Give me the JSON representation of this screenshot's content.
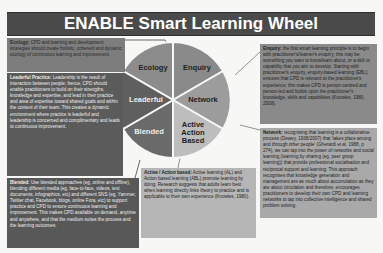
{
  "title": "ENABLE Smart Learning Wheel",
  "wheel": {
    "segments": [
      {
        "label": "Ecology",
        "color": "#8c8c8c"
      },
      {
        "label": "Enquiry",
        "color": "#8a8a8a"
      },
      {
        "label": "Network",
        "color": "#9a9a9a"
      },
      {
        "label": "Active Action Based",
        "color": "#bdbdbd"
      },
      {
        "label": "Blended",
        "color": "#6a6a6a"
      },
      {
        "label": "Leaderful",
        "color": "#5f5f5f"
      }
    ]
  },
  "boxes": {
    "ecology": {
      "heading": "Ecology:",
      "text": " CPD and learning and development strategies should create holistic, coherent and dynamic ecology of continuous learning and improvement."
    },
    "leaderful": {
      "heading": "Leaderful Practice:",
      "text": " Leadership is the result of interaction between people; hence, CPD should enable practitioners to build on their strengths, knowledge and expertise, and lead in their practice and area of expertise toward shared goals and within the context of their team. This creates a dynamic environment where practice is leaderful and leadership is concerned and complimentary and leads to continuous improvement."
    },
    "blended": {
      "heading": "Blended:",
      "text": " Use blended approaches (eg, online and offline), blending different media (eg, face-to-face, videos, text documents, infographics, etc) and different SNS (eg, Yammer, Twitter chat, Facebook, blogs, online Fora, etc) to support practice and CPD to ensure continuous learning and improvement. This makes CPD available on demand, anytime and anywhere, and that the medium suites the process and the learning outcomes."
    },
    "enquiry": {
      "heading": "Enquiry:",
      "text": " the first smart learning principle is to begin with practitioner's/learner's enquiry; this may be something you want to know/learn about, or a skill or capability that you aim to develop. Starting with practitioner's enquiry, enquiry-based learning (EBL), ensures that CPD is relevant to the practitioner's experience; this makes CPD is person-centred and person-led and builds upon the practitioner's knowledge, skills and capabilities (Knowles, 1980, 2008)."
    },
    "network": {
      "heading": "Network:",
      "text": " recognising that learning is a collaborative process (Dewey, 1938/2007) that 'takes place among and through other people' (Gherardi et al, 1988, p 274), we can tap into the power of networks and social learning (learning by sharing (eg, peer group learning)) that provide professional socialisation and reciprocal support and learning. This approach recognises that knowledge generation and management are as much about accumulation as they are about circulation and therefore, encourages practitioners to develop their own CPD and learning networks to tap into collective intelligence and shared problem solving."
    },
    "active": {
      "heading": "Active / Action based:",
      "text": " Active learning (AL) and Action based learning (ABL) promote learning by doing. Research suggests that adults learn best when learning directly links theory to practice and is applicable to their own experience (Knowles, 1980)."
    }
  }
}
